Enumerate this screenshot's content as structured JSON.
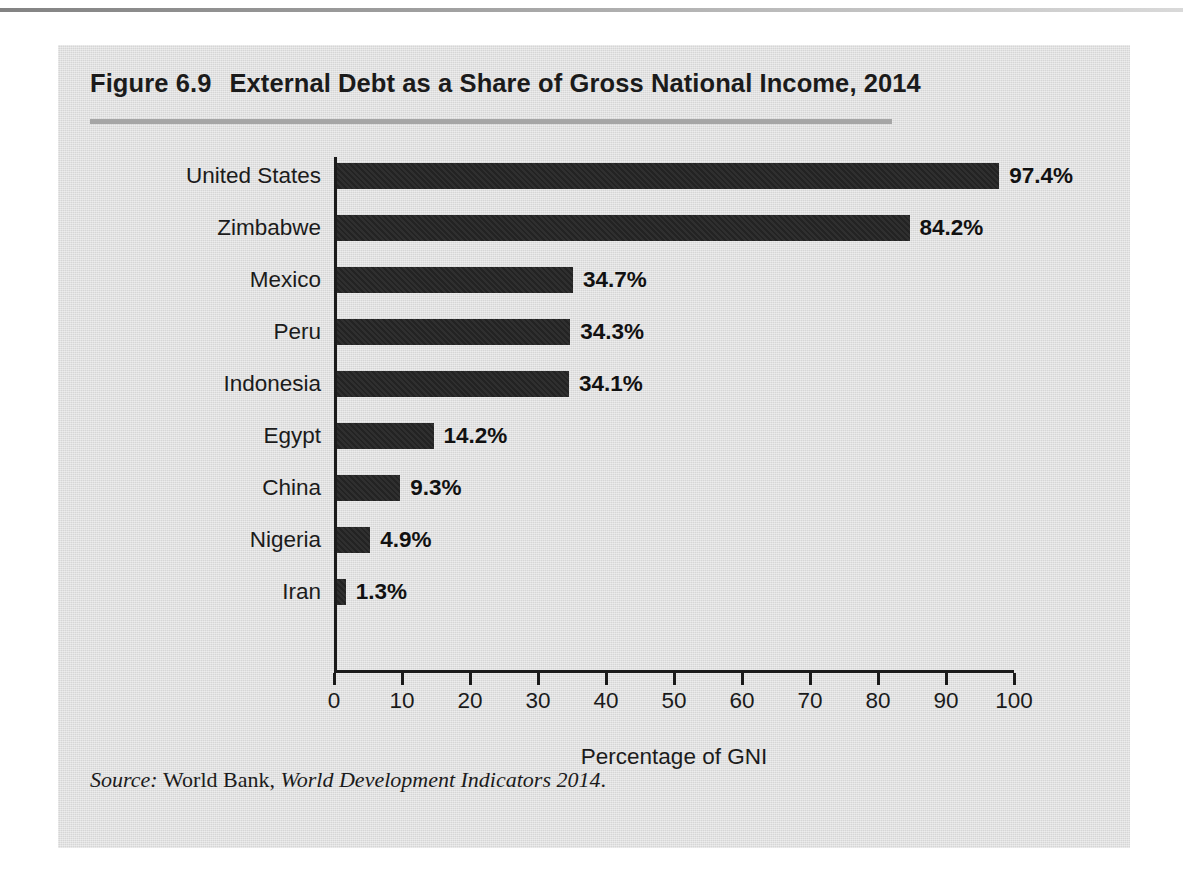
{
  "figure": {
    "number": "Figure 6.9",
    "title": "External Debt as a Share of Gross National Income, 2014",
    "source_prefix": "Source:",
    "source_publisher": "World Bank,",
    "source_publication": "World Development Indicators 2014",
    "source_suffix": "."
  },
  "colors": {
    "panel_background": "#dedede",
    "bar": "#232323",
    "axis": "#1b1b1b",
    "title_rule": "#a6a6a6",
    "text": "#1b1b1b"
  },
  "chart_data": {
    "type": "bar",
    "orientation": "horizontal",
    "title": "External Debt as a Share of Gross National Income, 2014",
    "xlabel": "Percentage of GNI",
    "ylabel": "",
    "xlim": [
      0,
      100
    ],
    "xticks": [
      0,
      10,
      20,
      30,
      40,
      50,
      60,
      70,
      80,
      90,
      100
    ],
    "xtick_labels": [
      "0",
      "10",
      "20",
      "30",
      "40",
      "50",
      "60",
      "70",
      "80",
      "90",
      "100"
    ],
    "grid": false,
    "legend": false,
    "categories": [
      "United States",
      "Zimbabwe",
      "Mexico",
      "Peru",
      "Indonesia",
      "Egypt",
      "China",
      "Nigeria",
      "Iran"
    ],
    "values": [
      97.4,
      84.2,
      34.7,
      34.3,
      34.1,
      14.2,
      9.3,
      4.9,
      1.3
    ],
    "value_labels": [
      "97.4%",
      "84.2%",
      "34.7%",
      "34.3%",
      "34.1%",
      "14.2%",
      "9.3%",
      "4.9%",
      "1.3%"
    ],
    "units": "percent"
  }
}
